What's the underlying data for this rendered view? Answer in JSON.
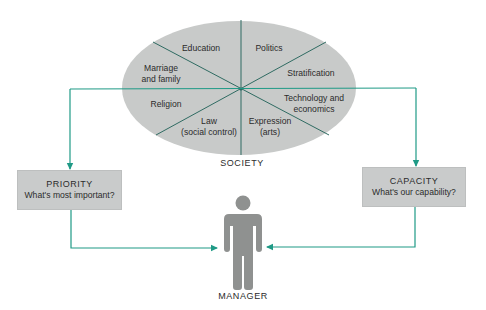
{
  "diagram": {
    "society": {
      "caption": "SOCIETY",
      "segments": [
        {
          "id": "education",
          "label": "Education"
        },
        {
          "id": "politics",
          "label": "Politics"
        },
        {
          "id": "marriage",
          "label": "Marriage\nand family"
        },
        {
          "id": "stratification",
          "label": "Stratification"
        },
        {
          "id": "religion",
          "label": "Religion"
        },
        {
          "id": "technology",
          "label": "Technology and\neconomics"
        },
        {
          "id": "law",
          "label": "Law\n(social control)"
        },
        {
          "id": "expression",
          "label": "Expression\n(arts)"
        }
      ]
    },
    "priority": {
      "title": "PRIORITY",
      "subtitle": "What's most important?"
    },
    "capacity": {
      "title": "CAPACITY",
      "subtitle": "What's our capability?"
    },
    "manager": {
      "caption": "MANAGER"
    },
    "colors": {
      "ellipse_fill": "#c8cac9",
      "divider_line": "#2f6b62",
      "arrow": "#1f9a86",
      "box_fill": "#c9cbcb",
      "figure": "#8f9190"
    }
  }
}
